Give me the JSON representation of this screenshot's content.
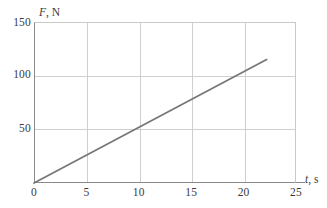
{
  "chart_data": {
    "type": "line",
    "title": "",
    "subtitle": "",
    "xlabel_variable": "t",
    "xlabel_unit": ", s",
    "xlabel_full": "t, s",
    "ylabel_variable": "F",
    "ylabel_unit": ", N",
    "ylabel_full": "F, N",
    "xlim": [
      0,
      25
    ],
    "ylim": [
      0,
      150
    ],
    "xticks": [
      0,
      5,
      10,
      15,
      20,
      25
    ],
    "xtick_labels": [
      "0",
      "5",
      "10",
      "15",
      "20",
      "25"
    ],
    "yticks": [
      0,
      50,
      100,
      150
    ],
    "ytick_labels": [
      "0",
      "50",
      "100",
      "150"
    ],
    "grid": true,
    "grid_color": "#cfcfcf",
    "axis_color": "#8a8a8a",
    "legend": null,
    "legend_position": "none",
    "series": [
      {
        "name": "F(t)",
        "color": "#777777",
        "width": 1.8,
        "x": [
          0,
          22.2
        ],
        "y": [
          0,
          115
        ],
        "slope_per_second": 5.18,
        "points": [
          {
            "x": 0,
            "y": 0
          },
          {
            "x": 5,
            "y": 26
          },
          {
            "x": 10,
            "y": 50
          },
          {
            "x": 15,
            "y": 78
          },
          {
            "x": 20,
            "y": 103
          },
          {
            "x": 22.2,
            "y": 115
          }
        ]
      }
    ],
    "annotations": []
  }
}
